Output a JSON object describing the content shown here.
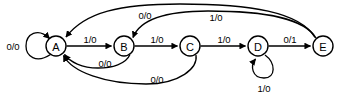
{
  "diagram": {
    "type": "finite-state-machine",
    "notation": "input/output",
    "states": [
      {
        "id": "A",
        "label": "A",
        "cx": 56,
        "cy": 46,
        "r": 10
      },
      {
        "id": "B",
        "label": "B",
        "cx": 124,
        "cy": 46,
        "r": 10
      },
      {
        "id": "C",
        "label": "C",
        "cx": 190,
        "cy": 46,
        "r": 10
      },
      {
        "id": "D",
        "label": "D",
        "cx": 258,
        "cy": 46,
        "r": 10
      },
      {
        "id": "E",
        "label": "E",
        "cx": 323,
        "cy": 46,
        "r": 10
      }
    ],
    "transitions": [
      {
        "id": "t-a-a",
        "from": "A",
        "to": "A",
        "label": "0/0",
        "label_x": 13,
        "label_y": 46
      },
      {
        "id": "t-a-b",
        "from": "A",
        "to": "B",
        "label": "1/0",
        "label_x": 90,
        "label_y": 39
      },
      {
        "id": "t-b-c",
        "from": "B",
        "to": "C",
        "label": "1/0",
        "label_x": 157,
        "label_y": 39
      },
      {
        "id": "t-c-d",
        "from": "C",
        "to": "D",
        "label": "1/0",
        "label_x": 224,
        "label_y": 39
      },
      {
        "id": "t-d-e",
        "from": "D",
        "to": "E",
        "label": "0/1",
        "label_x": 290,
        "label_y": 39
      },
      {
        "id": "t-d-d",
        "from": "D",
        "to": "D",
        "label": "1/0",
        "label_x": 264,
        "label_y": 88
      },
      {
        "id": "t-e-a",
        "from": "E",
        "to": "A",
        "label": "0/0",
        "label_x": 145,
        "label_y": 15
      },
      {
        "id": "t-e-b",
        "from": "E",
        "to": "B",
        "label": "1/0",
        "label_x": 216,
        "label_y": 17
      },
      {
        "id": "t-b-a",
        "from": "B",
        "to": "A",
        "label": "0/0",
        "label_x": 105,
        "label_y": 63
      },
      {
        "id": "t-c-a",
        "from": "C",
        "to": "A",
        "label": "0/0",
        "label_x": 157,
        "label_y": 79
      }
    ]
  },
  "colors": {
    "stroke": "#000000",
    "fill": "#ffffff",
    "text": "#000000"
  }
}
